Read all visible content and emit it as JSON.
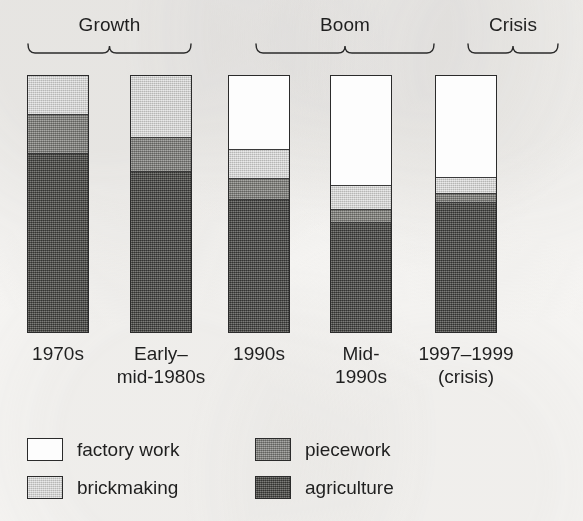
{
  "figure": {
    "background_color": "#f7f6f4",
    "ink_color": "#1f1f1f"
  },
  "periods": [
    {
      "label": "Growth",
      "brace_name": "brace-growth",
      "left": 27,
      "width": 165
    },
    {
      "label": "Boom",
      "brace_name": "brace-boom",
      "left": 255,
      "width": 180
    },
    {
      "label": "Crisis",
      "brace_name": "brace-crisis",
      "left": 467,
      "width": 92
    }
  ],
  "bars": [
    {
      "name": "bar-1970s",
      "tick_line1": "1970s",
      "tick_line2": "",
      "left": 27,
      "segments": [
        {
          "key": "factory",
          "percent": 0
        },
        {
          "key": "brick",
          "percent": 15
        },
        {
          "key": "piece",
          "percent": 15
        },
        {
          "key": "agri",
          "percent": 70
        }
      ]
    },
    {
      "name": "bar-early-mid-1980s",
      "tick_line1": "Early–",
      "tick_line2": "mid-1980s",
      "left": 130,
      "segments": [
        {
          "key": "factory",
          "percent": 0
        },
        {
          "key": "brick",
          "percent": 24
        },
        {
          "key": "piece",
          "percent": 13
        },
        {
          "key": "agri",
          "percent": 63
        }
      ]
    },
    {
      "name": "bar-1990s",
      "tick_line1": "1990s",
      "tick_line2": "",
      "left": 228,
      "segments": [
        {
          "key": "factory",
          "percent": 29
        },
        {
          "key": "brick",
          "percent": 11
        },
        {
          "key": "piece",
          "percent": 8
        },
        {
          "key": "agri",
          "percent": 52
        }
      ]
    },
    {
      "name": "bar-mid-1990s",
      "tick_line1": "Mid-",
      "tick_line2": "1990s",
      "left": 330,
      "segments": [
        {
          "key": "factory",
          "percent": 43
        },
        {
          "key": "brick",
          "percent": 9
        },
        {
          "key": "piece",
          "percent": 5
        },
        {
          "key": "agri",
          "percent": 43
        }
      ]
    },
    {
      "name": "bar-1997-1999",
      "tick_line1": "1997–1999",
      "tick_line2": "(crisis)",
      "left": 435,
      "segments": [
        {
          "key": "factory",
          "percent": 40
        },
        {
          "key": "brick",
          "percent": 6
        },
        {
          "key": "piece",
          "percent": 3
        },
        {
          "key": "agri",
          "percent": 51
        }
      ]
    }
  ],
  "legend": [
    {
      "key": "factory",
      "label": "factory work",
      "color": "#ffffff",
      "left": 27,
      "top": 14
    },
    {
      "key": "brick",
      "label": "brickmaking",
      "color": "#c9c9c7",
      "left": 27,
      "top": 52
    },
    {
      "key": "piece",
      "label": "piecework",
      "color": "#84847f",
      "left": 255,
      "top": 14
    },
    {
      "key": "agri",
      "label": "agriculture",
      "color": "#575753",
      "left": 255,
      "top": 52
    }
  ],
  "chart_data": {
    "type": "bar",
    "title": "",
    "subtitle": "",
    "xlabel": "",
    "ylabel": "",
    "stacked": true,
    "normalized": true,
    "ylim": [
      0,
      100
    ],
    "grid": false,
    "legend_position": "bottom",
    "annotations": [
      "Growth",
      "Boom",
      "Crisis"
    ],
    "categories": [
      "1970s",
      "Early–mid-1980s",
      "1990s",
      "Mid-1990s",
      "1997–1999 (crisis)"
    ],
    "series": [
      {
        "name": "factory work",
        "color": "#ffffff",
        "values": [
          0,
          0,
          29,
          43,
          40
        ]
      },
      {
        "name": "brickmaking",
        "color": "#c9c9c7",
        "values": [
          15,
          24,
          11,
          9,
          6
        ]
      },
      {
        "name": "piecework",
        "color": "#84847f",
        "values": [
          15,
          13,
          8,
          5,
          3
        ]
      },
      {
        "name": "agriculture",
        "color": "#575753",
        "values": [
          70,
          63,
          52,
          43,
          51
        ]
      }
    ]
  },
  "geometry": {
    "bar_width": 62,
    "bar_top": 75,
    "bar_bottom": 333
  }
}
